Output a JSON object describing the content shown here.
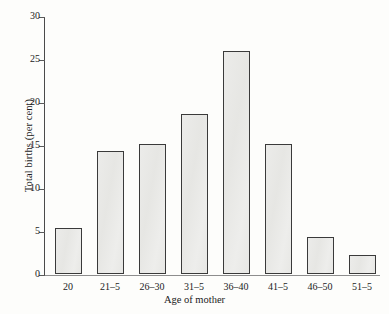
{
  "chart_data": {
    "type": "bar",
    "title": "",
    "xlabel": "Age of mother",
    "ylabel": "Total births (per cent)",
    "categories": [
      "20",
      "21–5",
      "26–30",
      "31–5",
      "36–40",
      "41–5",
      "46–50",
      "51–5"
    ],
    "values": [
      5.3,
      14.3,
      15.1,
      18.6,
      25.9,
      15.1,
      4.3,
      2.2
    ],
    "ylim": [
      0,
      30
    ],
    "yticks": [
      0,
      5,
      10,
      15,
      20,
      25,
      30
    ],
    "ytick_labels": [
      "0",
      "5",
      "10",
      "15",
      "20",
      "25",
      "30"
    ],
    "grid": false,
    "legend": null,
    "bar_color": "#e9e9e7",
    "bar_edge_color": "#3a3a3a",
    "axis_color": "#4a4a4a",
    "background": "#fdfdfb"
  }
}
